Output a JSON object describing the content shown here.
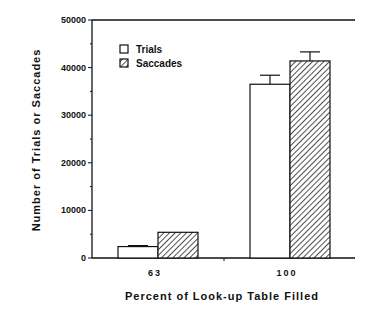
{
  "chart_data": {
    "type": "bar",
    "title": "",
    "xlabel": "Percent of Look-up Table Filled",
    "ylabel": "Number of Trials or Saccades",
    "categories": [
      "63",
      "100"
    ],
    "series": [
      {
        "name": "Trials",
        "values": [
          2400,
          36500
        ],
        "error": [
          200,
          1900
        ],
        "fill": "white"
      },
      {
        "name": "Saccades",
        "values": [
          5400,
          41400
        ],
        "error": [
          0,
          1900
        ],
        "fill": "hatched"
      }
    ],
    "ylim": [
      0,
      50000
    ],
    "yticks": [
      "0",
      "10000",
      "20000",
      "30000",
      "40000",
      "50000"
    ],
    "grid": false,
    "legend_position": "upper-left"
  }
}
